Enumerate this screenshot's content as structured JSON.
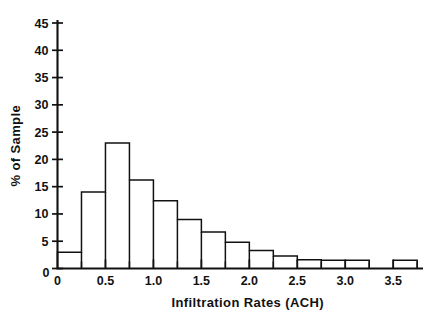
{
  "chart_data": {
    "type": "bar",
    "title": "",
    "xlabel": "Infiltration Rates (ACH)",
    "ylabel": "% of Sample",
    "xlim": [
      0,
      3.8
    ],
    "ylim": [
      0,
      46.5
    ],
    "grid": false,
    "legend": null,
    "bin_width": 0.25,
    "bin_edges": [
      0,
      0.25,
      0.5,
      0.75,
      1.0,
      1.25,
      1.5,
      1.75,
      2.0,
      2.25,
      2.5,
      2.75,
      3.0,
      3.25,
      3.5,
      3.75
    ],
    "categories": [
      "0-0.25",
      "0.25-0.5",
      "0.5-0.75",
      "0.75-1.0",
      "1.0-1.25",
      "1.25-1.5",
      "1.5-1.75",
      "1.75-2.0",
      "2.0-2.25",
      "2.25-2.5",
      "2.5-2.75",
      "2.75-3.0",
      "3.0-3.25",
      "3.25-3.5",
      "3.5-3.75"
    ],
    "values": [
      3.0,
      14.0,
      23.0,
      16.2,
      12.4,
      9.0,
      6.7,
      4.8,
      3.3,
      2.3,
      1.6,
      1.5,
      1.5,
      0.0,
      1.5
    ],
    "yticks": [
      0,
      5,
      10,
      15,
      20,
      25,
      30,
      35,
      40,
      45
    ],
    "yticklabels": [
      "0",
      "5",
      "10",
      "15",
      "20",
      "25",
      "30",
      "35",
      "40",
      "45"
    ],
    "xticks": [
      0,
      0.25,
      0.5,
      0.75,
      1.0,
      1.25,
      1.5,
      1.75,
      2.0,
      2.25,
      2.5,
      2.75,
      3.0,
      3.25,
      3.5,
      3.75
    ],
    "xticklabels_major": [
      {
        "value": 0,
        "label": "0"
      },
      {
        "value": 0.5,
        "label": "0.5"
      },
      {
        "value": 1.0,
        "label": "1.0"
      },
      {
        "value": 1.5,
        "label": "1.5"
      },
      {
        "value": 2.0,
        "label": "2.0"
      },
      {
        "value": 2.5,
        "label": "2.5"
      },
      {
        "value": 3.0,
        "label": "3.0"
      },
      {
        "value": 3.5,
        "label": "3.5"
      }
    ],
    "colors": {
      "bar_edge": "#111111",
      "bar_fill": "#ffffff",
      "axis": "#111111",
      "background": "#ffffff",
      "text": "#111111"
    }
  }
}
